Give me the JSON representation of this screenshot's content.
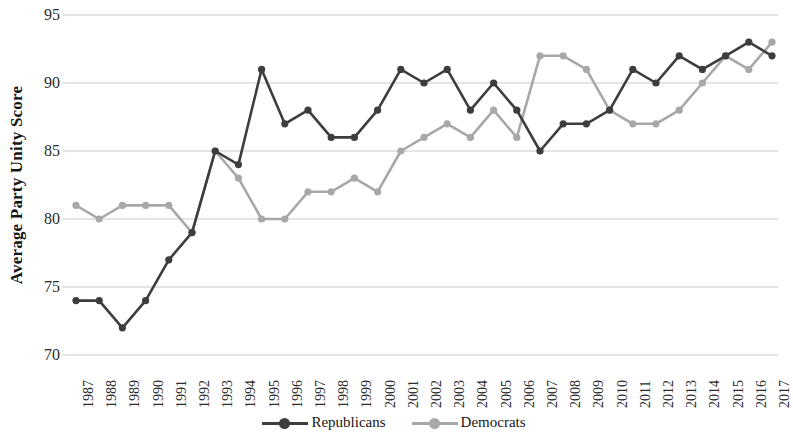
{
  "chart_data": {
    "type": "line",
    "title": "",
    "xlabel": "",
    "ylabel": "Average Party Unity Score",
    "ylim": [
      70,
      95
    ],
    "ytick_values": [
      95,
      90,
      85,
      80,
      75,
      70
    ],
    "grid": "horizontal",
    "legend_position": "bottom-center",
    "x": [
      1987,
      1988,
      1989,
      1990,
      1991,
      1992,
      1993,
      1994,
      1995,
      1996,
      1997,
      1998,
      1999,
      2000,
      2001,
      2002,
      2003,
      2004,
      2005,
      2006,
      2007,
      2008,
      2009,
      2010,
      2011,
      2012,
      2013,
      2014,
      2015,
      2016,
      2017
    ],
    "categories": [
      "1987",
      "1988",
      "1989",
      "1990",
      "1991",
      "1992",
      "1993",
      "1994",
      "1995",
      "1996",
      "1997",
      "1998",
      "1999",
      "2000",
      "2001",
      "2002",
      "2003",
      "2004",
      "2005",
      "2006",
      "2007",
      "2008",
      "2009",
      "2010",
      "2011",
      "2012",
      "2013",
      "2014",
      "2015",
      "2016",
      "2017"
    ],
    "series": [
      {
        "name": "Republicans",
        "color": "#3d3d3d",
        "marker": "circle",
        "values": [
          74,
          74,
          72,
          74,
          77,
          79,
          85,
          84,
          91,
          87,
          88,
          86,
          86,
          88,
          91,
          90,
          91,
          88,
          90,
          88,
          85,
          87,
          87,
          88,
          91,
          90,
          92,
          91,
          92,
          93,
          92
        ]
      },
      {
        "name": "Democrats",
        "color": "#a8a8a8",
        "marker": "circle",
        "values": [
          81,
          80,
          81,
          81,
          81,
          79,
          85,
          83,
          80,
          80,
          82,
          82,
          83,
          82,
          85,
          86,
          87,
          86,
          88,
          86,
          92,
          92,
          91,
          88,
          87,
          87,
          88,
          90,
          92,
          91,
          93
        ]
      }
    ]
  },
  "legend": {
    "items": [
      {
        "label": "Republicans",
        "color": "#3d3d3d"
      },
      {
        "label": "Democrats",
        "color": "#a8a8a8"
      }
    ]
  },
  "axes": {
    "y_title": "Average Party Unity Score"
  }
}
